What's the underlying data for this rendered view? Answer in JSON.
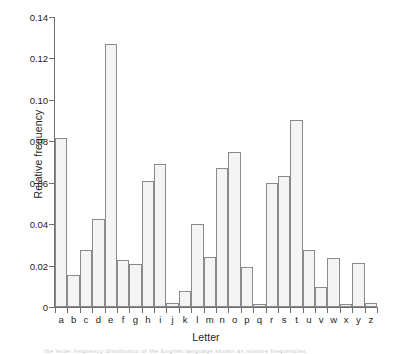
{
  "chart_data": {
    "type": "bar",
    "title": "",
    "xlabel": "Letter",
    "ylabel": "Relative frequency",
    "categories": [
      "a",
      "b",
      "c",
      "d",
      "e",
      "f",
      "g",
      "h",
      "i",
      "j",
      "k",
      "l",
      "m",
      "n",
      "o",
      "p",
      "q",
      "r",
      "s",
      "t",
      "u",
      "v",
      "w",
      "x",
      "y",
      "z"
    ],
    "values": [
      0.0815,
      0.0155,
      0.0277,
      0.0425,
      0.127,
      0.0228,
      0.0209,
      0.061,
      0.069,
      0.002,
      0.0078,
      0.04,
      0.024,
      0.067,
      0.075,
      0.0195,
      0.0015,
      0.06,
      0.0632,
      0.0905,
      0.0275,
      0.0097,
      0.0236,
      0.0015,
      0.0212,
      0.0018
    ],
    "ylim": [
      0,
      0.14
    ],
    "yticks": [
      0,
      0.02,
      0.04,
      0.06,
      0.08,
      0.1,
      0.12,
      0.14
    ],
    "ytick_labels": [
      "0",
      "0.02",
      "0.04",
      "0.06",
      "0.08",
      "0.10",
      "0.12",
      "0.14"
    ],
    "grid": false,
    "legend": false,
    "bar_fill_color": "#f4f4f4",
    "bar_edge_color": "#8a8a8a",
    "axis_color": "#6d6e70",
    "text_color": "#231f20"
  },
  "caption_strip": "the letter frequency distribution of the English language shown as relative frequencies"
}
